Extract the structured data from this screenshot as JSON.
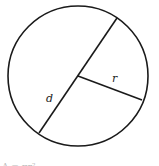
{
  "diagram": {
    "shape": "circle",
    "labels": {
      "diameter": "d",
      "radius": "r"
    },
    "caption_partial": "A = πr²",
    "colors": {
      "stroke": "#1a1a1a",
      "background": "#ffffff"
    }
  }
}
